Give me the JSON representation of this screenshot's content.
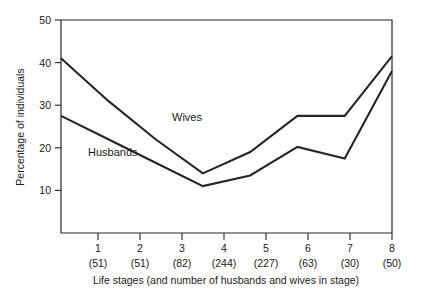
{
  "chart_data": {
    "type": "line",
    "title": "",
    "xlabel": "Life stages (and number of  husbands and wives in stage)",
    "ylabel": "Percentage of individuals",
    "categories": [
      "1",
      "2",
      "3",
      "4",
      "5",
      "6",
      "7",
      "8"
    ],
    "category_counts": [
      "(51)",
      "(51)",
      "(82)",
      "(244)",
      "(227)",
      "(63)",
      "(30)",
      "(50)"
    ],
    "x": [
      1,
      2,
      3,
      4,
      5,
      6,
      7,
      8
    ],
    "ylim": [
      0,
      50
    ],
    "yticks": [
      10,
      20,
      30,
      40,
      50
    ],
    "ytick_labels": [
      "10",
      "20",
      "30",
      "40",
      "50"
    ],
    "grid": false,
    "legend_position": "inline-annotation",
    "series": [
      {
        "name": "Wives",
        "color": "#262626",
        "values": [
          41.0,
          31.0,
          22.0,
          14.0,
          19.0,
          27.5,
          27.5,
          41.5
        ]
      },
      {
        "name": "Husbands",
        "color": "#262626",
        "values": [
          27.5,
          22.0,
          16.5,
          11.0,
          13.5,
          20.2,
          17.5,
          38.0
        ]
      }
    ],
    "annotations": [
      {
        "text": "Wives",
        "x_px": 172,
        "y_px": 121
      },
      {
        "text": "Husbands",
        "x_px": 88,
        "y_px": 156
      }
    ]
  },
  "figure": {
    "background_color": "#ffffff",
    "axis_color": "#262626",
    "line_color": "#262626"
  }
}
